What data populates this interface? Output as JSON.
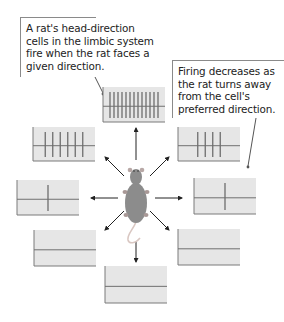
{
  "callouts": [
    {
      "id": "head-direction-callout",
      "lines": [
        "A rat's head-direction",
        "cells in the limbic system",
        "fire when the rat faces a",
        "given direction."
      ]
    },
    {
      "id": "firing-decreases-callout",
      "lines": [
        "Firing decreases as",
        "the rat turns away",
        "from the cell's",
        "preferred direction."
      ]
    }
  ],
  "colors": {
    "box_fill": "#e6e6e6",
    "box_border": "#7a7a7a",
    "spike": "#6e6e6e",
    "baseline": "#707070",
    "arrow": "#222222",
    "rat_body": "#8c8c8c",
    "rat_tail": "#d9c7c2"
  },
  "chart_data": {
    "type": "diagram",
    "recordings": [
      {
        "direction": "north",
        "spike_count": 13
      },
      {
        "direction": "northwest",
        "spike_count": 6
      },
      {
        "direction": "northeast",
        "spike_count": 4
      },
      {
        "direction": "west",
        "spike_count": 1
      },
      {
        "direction": "east",
        "spike_count": 1
      },
      {
        "direction": "southwest",
        "spike_count": 0
      },
      {
        "direction": "southeast",
        "spike_count": 0
      },
      {
        "direction": "south",
        "spike_count": 0
      }
    ]
  }
}
